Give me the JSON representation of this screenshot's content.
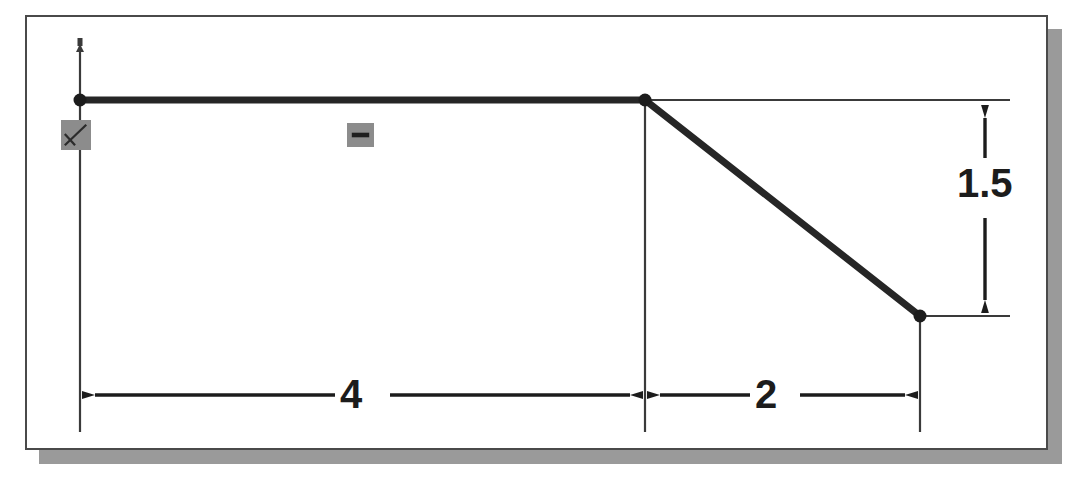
{
  "app": {
    "kind": "cad-sketch-view",
    "background_color": "#ffffff",
    "panel_color": "#ffffff",
    "panel_border_color": "#4a4a4a",
    "shadow_color": "#9a9a9a",
    "geometry_color": "#262626",
    "dimension_color": "#1c1c1c",
    "constraint_color": "#8c8c8c"
  },
  "sketch": {
    "title": "Sketch profile with linear dimensions",
    "entities": [
      {
        "name": "horizontal-line",
        "type": "line",
        "x1": 80,
        "y1": 100,
        "x2": 645,
        "y2": 100,
        "weight": "thick"
      },
      {
        "name": "sloped-line",
        "type": "line",
        "x1": 645,
        "y1": 100,
        "x2": 920,
        "y2": 316,
        "weight": "thick"
      }
    ],
    "points": [
      {
        "name": "origin-point",
        "x": 80,
        "y": 100
      },
      {
        "name": "vertex-point",
        "x": 645,
        "y": 100
      },
      {
        "name": "end-point",
        "x": 920,
        "y": 316
      }
    ],
    "constraints": [
      {
        "name": "fix-constraint",
        "glyph": "fix-anchor-icon",
        "label": ""
      },
      {
        "name": "horizontal-constraint",
        "glyph": "horizontal-icon",
        "label": ""
      }
    ]
  },
  "dimensions": [
    {
      "name": "width-dimension-4",
      "value": "4",
      "orientation": "horizontal",
      "from_x": 80,
      "to_x": 645,
      "line_y": 395
    },
    {
      "name": "width-dimension-2",
      "value": "2",
      "orientation": "horizontal",
      "from_x": 645,
      "to_x": 920,
      "line_y": 395
    },
    {
      "name": "height-dimension-1point5",
      "value": "1.5",
      "orientation": "vertical",
      "from_y": 100,
      "to_y": 316,
      "line_x": 985
    }
  ],
  "labels": {
    "dim_4": "4",
    "dim_2": "2",
    "dim_15": "1.5"
  }
}
